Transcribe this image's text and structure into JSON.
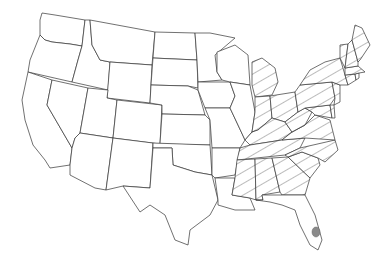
{
  "map": {
    "type": "choropleth-us-states",
    "pattern": "diagonal-hatch",
    "hatched_states": [
      "Michigan",
      "Indiana",
      "Ohio",
      "Kentucky",
      "Tennessee",
      "Mississippi",
      "Alabama",
      "Georgia",
      "South Carolina",
      "North Carolina",
      "Virginia",
      "West Virginia",
      "Pennsylvania",
      "New York",
      "Vermont",
      "New Hampshire",
      "Maine",
      "Massachusetts",
      "Connecticut",
      "Rhode Island",
      "New Jersey",
      "Delaware",
      "Maryland"
    ],
    "unhatched_states": [
      "Washington",
      "Oregon",
      "California",
      "Nevada",
      "Idaho",
      "Montana",
      "Wyoming",
      "Utah",
      "Arizona",
      "Colorado",
      "New Mexico",
      "North Dakota",
      "South Dakota",
      "Nebraska",
      "Kansas",
      "Oklahoma",
      "Texas",
      "Minnesota",
      "Iowa",
      "Missouri",
      "Arkansas",
      "Louisiana",
      "Wisconsin",
      "Illinois",
      "Florida"
    ],
    "markers": [
      {
        "location": "South Florida",
        "shape": "dot",
        "color": "#8a8a8a"
      }
    ],
    "colors": {
      "outline": "#333333",
      "hatch": "#555555",
      "background": "#ffffff",
      "marker": "#8a8a8a"
    }
  }
}
